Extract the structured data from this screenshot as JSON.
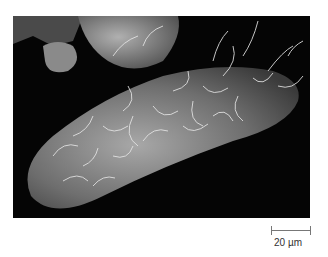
{
  "figure": {
    "background_color": "#050505"
  },
  "scale_bar": {
    "label": "20 µm",
    "color": "#777777"
  }
}
